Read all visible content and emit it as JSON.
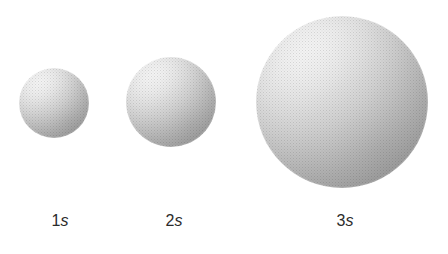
{
  "figure": {
    "background_color": "#ffffff",
    "width": 448,
    "height": 254
  },
  "style": {
    "sphere_highlight_color": "#fdfdfd",
    "sphere_midtone_color": "#c4c4c4",
    "sphere_rim_color": "#8b8b8b",
    "label_color": "#2b2b2b"
  },
  "chart_data": {
    "type": "scatter",
    "title": "",
    "xlabel": "",
    "ylabel": "",
    "grid": false,
    "legend": null,
    "categories": [
      "1s",
      "2s",
      "3s"
    ],
    "values": [
      70,
      90,
      172
    ],
    "value_unit": "px diameter",
    "points": [
      {
        "label_n": "1",
        "label_l": "s",
        "label": "1s",
        "cx": 54,
        "cy": 103,
        "diameter": 70
      },
      {
        "label_n": "2",
        "label_l": "s",
        "label": "2s",
        "cx": 171,
        "cy": 102,
        "diameter": 90
      },
      {
        "label_n": "3",
        "label_l": "s",
        "label": "3s",
        "cx": 342,
        "cy": 102,
        "diameter": 172
      }
    ]
  },
  "labels": [
    {
      "n": "1",
      "l": "s",
      "x": 60
    },
    {
      "n": "2",
      "l": "s",
      "x": 174
    },
    {
      "n": "3",
      "l": "s",
      "x": 345
    }
  ]
}
